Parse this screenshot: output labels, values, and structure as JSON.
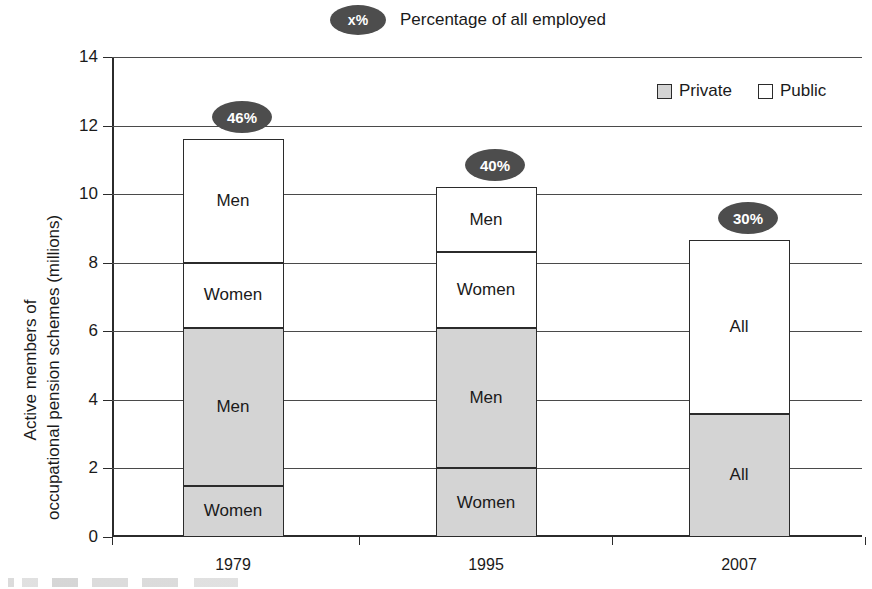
{
  "key_note": {
    "badge_text": "x%",
    "label": "Percentage of all employed"
  },
  "legend": {
    "items": [
      {
        "label": "Private",
        "swatch": "private-swatch",
        "color": "#d4d4d4"
      },
      {
        "label": "Public",
        "swatch": "public-swatch",
        "color": "#ffffff"
      }
    ]
  },
  "axis": {
    "y_title_line1": "Active members of",
    "y_title_line2": "occupational pension schemes (millions)",
    "y_ticks": [
      "0",
      "2",
      "4",
      "6",
      "8",
      "10",
      "12",
      "14"
    ],
    "x_ticks": [
      "1979",
      "1995",
      "2007"
    ]
  },
  "chart_data": {
    "type": "bar",
    "title": "",
    "subtitle": "",
    "xlabel": "",
    "ylabel": "Active members of occupational pension schemes (millions)",
    "ylim": [
      0,
      14
    ],
    "ytick_values": [
      0,
      2,
      4,
      6,
      8,
      10,
      12,
      14
    ],
    "grid": true,
    "stacked": true,
    "legend_position": "top-right",
    "categories": [
      "1979",
      "1995",
      "2007"
    ],
    "series": [
      {
        "name": "Private Women",
        "sector": "Private",
        "group": "Women",
        "values": [
          1.5,
          2.0,
          null
        ]
      },
      {
        "name": "Private Men",
        "sector": "Private",
        "group": "Men",
        "values": [
          4.6,
          4.1,
          null
        ]
      },
      {
        "name": "Private All",
        "sector": "Private",
        "group": "All",
        "values": [
          null,
          null,
          3.6
        ]
      },
      {
        "name": "Public Women",
        "sector": "Public",
        "group": "Women",
        "values": [
          1.9,
          2.2,
          null
        ]
      },
      {
        "name": "Public Men",
        "sector": "Public",
        "group": "Men",
        "values": [
          3.6,
          1.9,
          null
        ]
      },
      {
        "name": "Public All",
        "sector": "Public",
        "group": "All",
        "values": [
          null,
          null,
          5.05
        ]
      }
    ],
    "totals": [
      11.6,
      10.2,
      8.65
    ],
    "segments": [
      {
        "category": "1979",
        "total": 11.6,
        "badge": "46%",
        "stack": [
          {
            "label": "Women",
            "sector": "Private",
            "start": 0.0,
            "end": 1.5,
            "value": 1.5
          },
          {
            "label": "Men",
            "sector": "Private",
            "start": 1.5,
            "end": 6.1,
            "value": 4.6
          },
          {
            "label": "Women",
            "sector": "Public",
            "start": 6.1,
            "end": 8.0,
            "value": 1.9
          },
          {
            "label": "Men",
            "sector": "Public",
            "start": 8.0,
            "end": 11.6,
            "value": 3.6
          }
        ]
      },
      {
        "category": "1995",
        "total": 10.2,
        "badge": "40%",
        "stack": [
          {
            "label": "Women",
            "sector": "Private",
            "start": 0.0,
            "end": 2.0,
            "value": 2.0
          },
          {
            "label": "Men",
            "sector": "Private",
            "start": 2.0,
            "end": 6.1,
            "value": 4.1
          },
          {
            "label": "Women",
            "sector": "Public",
            "start": 6.1,
            "end": 8.3,
            "value": 2.2
          },
          {
            "label": "Men",
            "sector": "Public",
            "start": 8.3,
            "end": 10.2,
            "value": 1.9
          }
        ]
      },
      {
        "category": "2007",
        "total": 8.65,
        "badge": "30%",
        "stack": [
          {
            "label": "All",
            "sector": "Private",
            "start": 0.0,
            "end": 3.6,
            "value": 3.6
          },
          {
            "label": "All",
            "sector": "Public",
            "start": 3.6,
            "end": 8.65,
            "value": 5.05
          }
        ]
      }
    ],
    "annotations": [
      {
        "text": "46%",
        "category": "1979",
        "meaning": "Percentage of all employed"
      },
      {
        "text": "40%",
        "category": "1995",
        "meaning": "Percentage of all employed"
      },
      {
        "text": "30%",
        "category": "2007",
        "meaning": "Percentage of all employed"
      }
    ]
  }
}
